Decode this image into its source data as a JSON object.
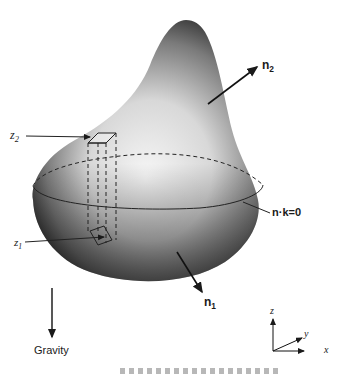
{
  "figure": {
    "labels": {
      "n2": {
        "main": "n",
        "sub": "2"
      },
      "n1": {
        "main": "n",
        "sub": "1"
      },
      "nk": "n·k=0",
      "z2": {
        "main": "z",
        "sub": "2"
      },
      "z1": {
        "main": "z",
        "sub": "1"
      },
      "gravity": "Gravity",
      "axis_x": "x",
      "axis_y": "y",
      "axis_z": "z"
    },
    "colors": {
      "ink": "#1a1a1a",
      "body_light": "#f2f2f2",
      "body_dark": "#3a3a3a",
      "background": "#ffffff"
    }
  }
}
